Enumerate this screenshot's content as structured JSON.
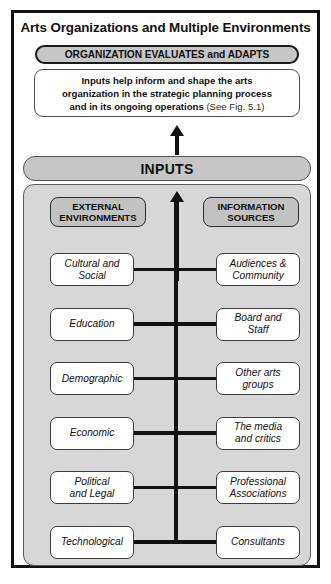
{
  "figure": {
    "title": "Arts Organizations and Multiple Environments",
    "banner": "ORGANIZATION EVALUATES and ADAPTS",
    "description": {
      "line1": "Inputs help inform and shape the arts",
      "line2": "organization in the strategic planning process",
      "line3_bold": "and in its ongoing operations",
      "line3_ref": "(See Fig. 5.1)"
    },
    "inputs_bar": "INPUTS",
    "columns": {
      "left": {
        "header_line1": "EXTERNAL",
        "header_line2": "ENVIRONMENTS"
      },
      "right": {
        "header_line1": "INFORMATION",
        "header_line2": "SOURCES"
      }
    },
    "rows": [
      {
        "left_line1": "Cultural and",
        "left_line2": "Social",
        "right_line1": "Audiences &",
        "right_line2": "Community"
      },
      {
        "left_line1": "Education",
        "left_line2": "",
        "right_line1": "Board and",
        "right_line2": "Staff"
      },
      {
        "left_line1": "Demographic",
        "left_line2": "",
        "right_line1": "Other arts",
        "right_line2": "groups"
      },
      {
        "left_line1": "Economic",
        "left_line2": "",
        "right_line1": "The media",
        "right_line2": "and critics"
      },
      {
        "left_line1": "Political",
        "left_line2": "and Legal",
        "right_line1": "Professional",
        "right_line2": "Associations"
      },
      {
        "left_line1": "Technological",
        "left_line2": "",
        "right_line1": "Consultants",
        "right_line2": ""
      }
    ],
    "colors": {
      "frame": "#111111",
      "banner_fill": "#c6c6c6",
      "panel_fill": "#d7d7d7",
      "pill_fill": "#c2c2c2",
      "item_fill": "#ffffff",
      "line": "#111111"
    }
  }
}
